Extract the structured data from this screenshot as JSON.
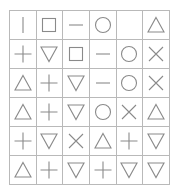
{
  "diagram": {
    "type": "symbol-matrix",
    "rows": 6,
    "columns": 6,
    "background_color": "#ffffff",
    "grid_line_color": "#b9b9b9",
    "symbol_stroke_color": "#8a8a8a",
    "symbol_legend": {
      "vertical-line": "vertical bar stroke",
      "square": "open square outline",
      "dash": "short horizontal line",
      "circle": "open circle outline",
      "triangle-up": "open upward triangle",
      "triangle-down": "open downward triangle",
      "plus": "plus sign",
      "cross": "diagonal cross (X)",
      "empty": "blank cell"
    },
    "cells": [
      [
        "vertical-line",
        "square",
        "dash",
        "circle",
        "empty",
        "triangle-up"
      ],
      [
        "plus",
        "triangle-down",
        "square",
        "dash",
        "circle",
        "cross"
      ],
      [
        "triangle-up",
        "plus",
        "triangle-down",
        "dash",
        "circle",
        "cross"
      ],
      [
        "triangle-up",
        "plus",
        "triangle-down",
        "circle",
        "cross",
        "triangle-up"
      ],
      [
        "plus",
        "triangle-down",
        "cross",
        "triangle-up",
        "plus",
        "triangle-down"
      ],
      [
        "triangle-up",
        "plus",
        "triangle-down",
        "plus",
        "triangle-down",
        "triangle-down"
      ]
    ]
  }
}
